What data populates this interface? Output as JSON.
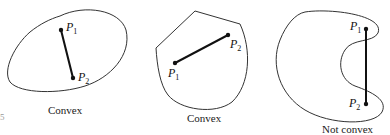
{
  "figures": [
    {
      "caption": "Convex",
      "p1": "P",
      "p1_sub": "1",
      "p2": "P",
      "p2_sub": "2"
    },
    {
      "caption": "Convex",
      "p1": "P",
      "p1_sub": "1",
      "p2": "P",
      "p2_sub": "2"
    },
    {
      "caption": "Not convex",
      "p1": "P",
      "p1_sub": "1",
      "p2": "P",
      "p2_sub": "2"
    }
  ],
  "margin_mark": "5"
}
